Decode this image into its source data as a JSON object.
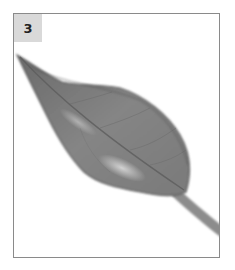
{
  "figure": {
    "panel_label": "3",
    "colors": {
      "border": "#8a8a8a",
      "label_bg": "#d9d9d9",
      "leaf_dark": "#5e5e5e",
      "leaf_mid": "#8a8a8a",
      "leaf_light": "#c8c8c8"
    }
  }
}
